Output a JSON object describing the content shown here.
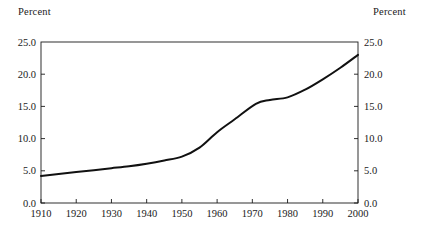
{
  "chart_data": {
    "type": "line",
    "title": "",
    "xlabel": "",
    "ylabel": "Percent",
    "ylabel_right": "Percent",
    "xlim": [
      1910,
      2000
    ],
    "ylim": [
      0.0,
      25.0
    ],
    "grid": false,
    "legend": null,
    "axis_left_title": "Percent",
    "axis_right_title": "Percent",
    "ytick_labels": [
      "25.0",
      "20.0",
      "15.0",
      "10.0",
      "5.0",
      "0.0"
    ],
    "ytick_values": [
      25.0,
      20.0,
      15.0,
      10.0,
      5.0,
      0.0
    ],
    "ytick_labels_right": [
      "25.0",
      "20.0",
      "15.0",
      "10.0",
      "5.0",
      "0.0"
    ],
    "xtick_labels": [
      "1910",
      "1920",
      "1930",
      "1940",
      "1950",
      "1960",
      "1970",
      "1980",
      "1990",
      "2000"
    ],
    "xtick_values": [
      1910,
      1920,
      1930,
      1940,
      1950,
      1960,
      1970,
      1980,
      1990,
      2000
    ],
    "series": [
      {
        "name": "Percent",
        "color": "#111111",
        "x": [
          1910,
          1915,
          1920,
          1925,
          1930,
          1935,
          1940,
          1945,
          1950,
          1955,
          1960,
          1965,
          1971,
          1975,
          1980,
          1985,
          1990,
          1995,
          2000
        ],
        "values": [
          4.2,
          4.5,
          4.8,
          5.1,
          5.4,
          5.7,
          6.1,
          6.6,
          7.2,
          8.6,
          11.0,
          13.0,
          15.4,
          16.0,
          16.4,
          17.6,
          19.2,
          21.0,
          23.0
        ]
      }
    ]
  }
}
